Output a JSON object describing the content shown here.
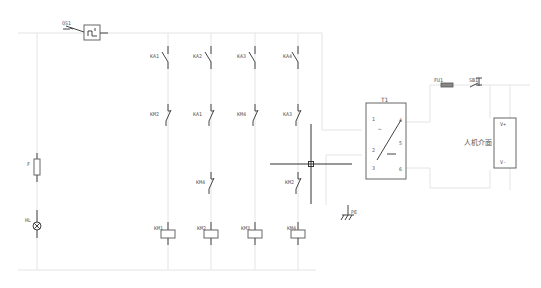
{
  "diagram": {
    "type": "electrical-schematic",
    "breaker": {
      "label": "QS1"
    },
    "columns": [
      {
        "no_contact": "KA1",
        "nc_contact": "KM2",
        "extra_nc": null,
        "coil": "KM1"
      },
      {
        "no_contact": "KA2",
        "nc_contact": "KA1",
        "extra_nc": "KM4",
        "coil": "KM2"
      },
      {
        "no_contact": "KA3",
        "nc_contact": "KM4",
        "extra_nc": null,
        "coil": "KM3"
      },
      {
        "no_contact": "KA4",
        "nc_contact": "KA3",
        "extra_nc": "KM2",
        "coil": "KM4"
      }
    ],
    "left_branch": {
      "fuse_label": "F",
      "lamp_label": "HL"
    },
    "transformer": {
      "label": "T1",
      "terminals": [
        "1",
        "2",
        "3",
        "4",
        "5",
        "6"
      ],
      "symbols": {
        "ac": "~",
        "dc": "—"
      }
    },
    "output": {
      "fuse_label": "FU1",
      "switch_label": "SB1",
      "device_label": "人机介面",
      "vplus": "V+",
      "vminus": "V-"
    },
    "ground": {
      "label": "PE"
    },
    "colors": {
      "wire": "#e4e4e4",
      "symbol": "#444444",
      "background": "#ffffff"
    }
  }
}
